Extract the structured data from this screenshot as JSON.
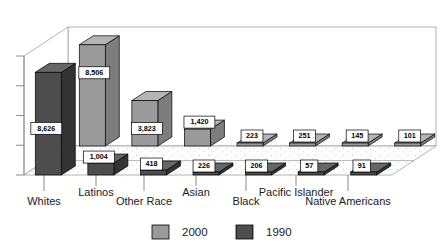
{
  "chart_data": {
    "type": "bar",
    "title": "",
    "subtitle": "",
    "xlabel": "",
    "ylabel": "",
    "categories": [
      "Whites",
      "Latinos",
      "Other Race",
      "Asian",
      "Black",
      "Pacific Islander",
      "Native Americans"
    ],
    "series": [
      {
        "name": "2000",
        "color": "#9a9a9a",
        "values": [
          8506,
          3823,
          1420,
          223,
          251,
          145,
          101
        ],
        "labels": [
          "8,506",
          "3,823",
          "1,420",
          "223",
          "251",
          "145",
          "101"
        ]
      },
      {
        "name": "1990",
        "color": "#4d4d4d",
        "values": [
          8626,
          1004,
          418,
          226,
          206,
          57,
          91
        ],
        "labels": [
          "8,626",
          "1,004",
          "418",
          "226",
          "206",
          "57",
          "91"
        ]
      }
    ],
    "ylim": [
      0,
      10000
    ],
    "ytick_count": 5,
    "ytick_labels": [],
    "grid": false,
    "legend_position": "bottom",
    "projection": "3d-two-row-depth",
    "data_labels": true
  },
  "legend": {
    "items": [
      {
        "label": "2000",
        "swatch_color": "#9a9a9a"
      },
      {
        "label": "1990",
        "swatch_color": "#4d4d4d"
      }
    ]
  },
  "axis": {
    "category_labels_row_top": [
      "Latinos",
      "Asian",
      "Pacific Islander"
    ],
    "category_labels_row_bottom": [
      "Whites",
      "Other Race",
      "Black",
      "Native Americans"
    ]
  },
  "colors": {
    "series_2000": "#9a9a9a",
    "series_2000_top": "#b5b5b5",
    "series_2000_side": "#7d7d7d",
    "series_1990": "#4d4d4d",
    "series_1990_top": "#666666",
    "series_1990_side": "#333333",
    "floor": "#fdfdfd",
    "wall": "#ffffff",
    "outline": "#000000",
    "frame": "#9aa0a6",
    "label_box_fill": "#ffffff",
    "label_box_stroke": "#000000",
    "text": "#1a1a1a"
  }
}
